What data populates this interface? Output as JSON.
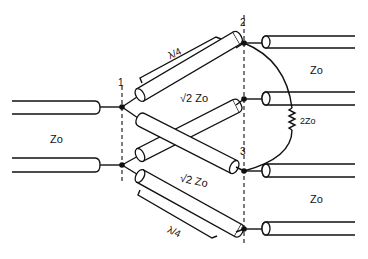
{
  "diagram": {
    "ports": {
      "port1": "1",
      "port2": "2",
      "port3": "3"
    },
    "labels": {
      "input_impedance": "Zo",
      "output_impedance_top": "Zo",
      "output_impedance_bottom": "Zo",
      "quarter_wave_top": "λ/4",
      "quarter_wave_bottom": "λ/4",
      "branch_impedance_top": "√2 Zo",
      "branch_impedance_bottom": "√2 Zo",
      "resistor_value": "2Zo"
    },
    "components": [
      {
        "type": "coax-input",
        "label": "Zo",
        "position": "left"
      },
      {
        "type": "coax-branch",
        "label": "√2 Zo",
        "length": "λ/4",
        "from": "port1-top",
        "to": "port2-top"
      },
      {
        "type": "coax-branch-crossed",
        "from": "port1-top",
        "to": "port3-top"
      },
      {
        "type": "coax-branch-crossed",
        "from": "port1-bottom",
        "to": "port2-bottom"
      },
      {
        "type": "coax-branch",
        "label": "√2 Zo",
        "length": "λ/4",
        "from": "port1-bottom",
        "to": "port3-bottom"
      },
      {
        "type": "resistor",
        "label": "2Zo",
        "between": "port2-top and port3-top"
      },
      {
        "type": "coax-output",
        "label": "Zo",
        "port": "2"
      },
      {
        "type": "coax-output",
        "label": "Zo",
        "port": "3"
      }
    ]
  }
}
